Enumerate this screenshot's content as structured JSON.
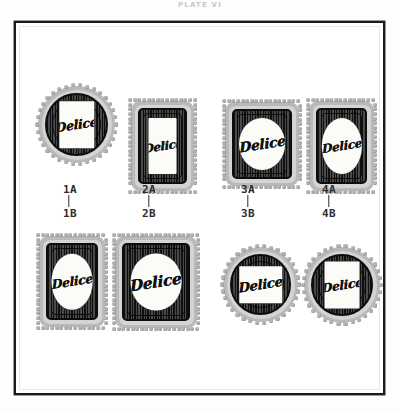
{
  "caption": {
    "text": "PLATE VI"
  },
  "plate": {
    "frame_color": "#1b1b1b",
    "background": "#ffffff"
  },
  "brand": {
    "name": "Delice"
  },
  "colors": {
    "scallop": "#b9b9b9",
    "band": "#d4d4d4",
    "body_dark": "#101010",
    "body_ridge": "#4a4a4a",
    "label_paper": "#fbfbf8",
    "tick_text": "#2c2c2c",
    "caption_text": "#c9c9c9"
  },
  "ticks": {
    "row_a": [
      "1A",
      "2A",
      "3A",
      "4A"
    ],
    "row_b": [
      "1B",
      "2B",
      "3B",
      "4B"
    ]
  },
  "items": [
    {
      "id": "1A",
      "shape": "round",
      "label_shape": "rect-tall",
      "brand": "Delice",
      "row": "A",
      "column": 1
    },
    {
      "id": "2A",
      "shape": "rect",
      "label_shape": "rect-tall",
      "brand": "Delice",
      "row": "A",
      "column": 2
    },
    {
      "id": "3A",
      "shape": "rect",
      "label_shape": "circle",
      "brand": "Delice",
      "row": "A",
      "column": 3
    },
    {
      "id": "4A",
      "shape": "rect",
      "label_shape": "circle",
      "brand": "Delice",
      "row": "A",
      "column": 4
    },
    {
      "id": "1B",
      "shape": "rect",
      "label_shape": "circle",
      "brand": "Delice",
      "row": "B",
      "column": 1
    },
    {
      "id": "2B",
      "shape": "rect",
      "label_shape": "circle",
      "brand": "Delice",
      "row": "B",
      "column": 2
    },
    {
      "id": "3B",
      "shape": "round",
      "label_shape": "square",
      "brand": "Delice",
      "row": "B",
      "column": 3
    },
    {
      "id": "4B",
      "shape": "round",
      "label_shape": "rect-tall",
      "brand": "Delice",
      "row": "B",
      "column": 4
    }
  ]
}
